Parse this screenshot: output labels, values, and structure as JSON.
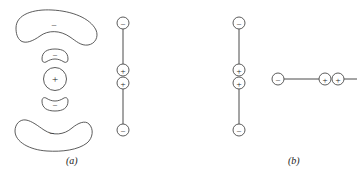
{
  "figure": {
    "panels": [
      {
        "id": "a",
        "label": "(a)",
        "label_x": 66,
        "label_y": 155,
        "lobe_diagram": {
          "name": "charge-lobe-diagram",
          "lobes": [
            {
              "name": "top-outer-lobe",
              "sign": "–",
              "sign_x": 54,
              "sign_y": 27,
              "shape": "crescent-down"
            },
            {
              "name": "upper-inner-lobe",
              "sign": "–",
              "sign_x": 55,
              "sign_y": 58,
              "shape": "small-cap-down"
            },
            {
              "name": "center-lobe",
              "sign": "+",
              "sign_x": 55,
              "sign_y": 79,
              "shape": "circle"
            },
            {
              "name": "lower-inner-lobe",
              "sign": "–",
              "sign_x": 55,
              "sign_y": 100,
              "shape": "small-cap-up"
            },
            {
              "name": "bottom-outer-lobe",
              "sign": "–",
              "sign_x": 52,
              "sign_y": 133,
              "shape": "crescent-up"
            }
          ]
        },
        "chain": {
          "name": "vertical-charge-chain-a",
          "orientation": "vertical",
          "axis_x": 123,
          "nodes": [
            {
              "name": "chain-node-minus-top",
              "sign": "–",
              "x": 123,
              "y": 23
            },
            {
              "name": "chain-node-plus-upper",
              "sign": "+",
              "x": 123,
              "y": 70
            },
            {
              "name": "chain-node-plus-lower",
              "sign": "+",
              "x": 123,
              "y": 83
            },
            {
              "name": "chain-node-minus-bottom",
              "sign": "–",
              "x": 123,
              "y": 130
            }
          ]
        }
      },
      {
        "id": "b",
        "label": "(b)",
        "label_x": 288,
        "label_y": 155,
        "chain_vertical": {
          "name": "vertical-charge-chain-b",
          "orientation": "vertical",
          "axis_x": 239,
          "nodes": [
            {
              "name": "chain-node-minus-top",
              "sign": "–",
              "x": 239,
              "y": 23
            },
            {
              "name": "chain-node-plus-upper",
              "sign": "+",
              "x": 239,
              "y": 70
            },
            {
              "name": "chain-node-plus-lower",
              "sign": "+",
              "x": 239,
              "y": 83
            },
            {
              "name": "chain-node-minus-bottom",
              "sign": "–",
              "x": 239,
              "y": 130
            }
          ]
        },
        "chain_horizontal": {
          "name": "horizontal-charge-chain-b",
          "orientation": "horizontal",
          "axis_y": 79,
          "clipped_right": true,
          "nodes": [
            {
              "name": "chain-node-minus-left",
              "sign": "–",
              "x": 278,
              "y": 79
            },
            {
              "name": "chain-node-plus-first",
              "sign": "+",
              "x": 325,
              "y": 79
            },
            {
              "name": "chain-node-plus-second",
              "sign": "+",
              "x": 338,
              "y": 79
            }
          ]
        }
      }
    ],
    "style": {
      "stroke_color": "#4a4a4a",
      "sign_color": "#1a1a1a",
      "background": "#ffffff",
      "node_radius": 6
    }
  }
}
